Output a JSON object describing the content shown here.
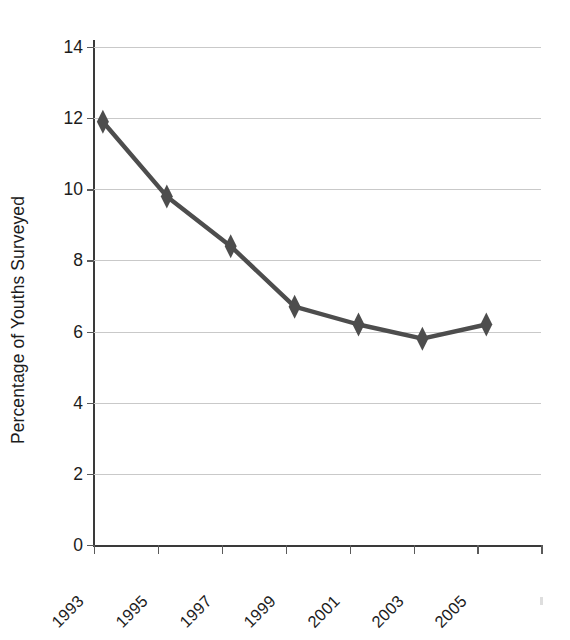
{
  "chart_data": {
    "type": "line",
    "title": "",
    "xlabel": "",
    "ylabel": "Percentage of Youths Surveyed",
    "x": [
      1993,
      1994,
      1995,
      1996,
      1997,
      1998,
      1999,
      2000,
      2001,
      2002,
      2003,
      2004,
      2005,
      2006
    ],
    "categories": [
      "1993",
      "1995",
      "1997",
      "1999",
      "2001",
      "2003",
      "2005"
    ],
    "values": [
      11.9,
      9.8,
      8.4,
      6.7,
      6.2,
      5.8,
      6.2
    ],
    "points": [
      {
        "label": "1993",
        "value": 11.9
      },
      {
        "label": "1995",
        "value": 9.8
      },
      {
        "label": "1997",
        "value": 8.4
      },
      {
        "label": "1999",
        "value": 6.7
      },
      {
        "label": "2001",
        "value": 6.2
      },
      {
        "label": "2003",
        "value": 5.8
      },
      {
        "label": "2005",
        "value": 6.2
      }
    ],
    "ylim": [
      0,
      14
    ],
    "ytick_labels": [
      "0",
      "2",
      "4",
      "6",
      "8",
      "10",
      "12",
      "14"
    ],
    "ytick_values": [
      0,
      2,
      4,
      6,
      8,
      10,
      12,
      14
    ],
    "xtick_labels": [
      "1993",
      "1995",
      "1997",
      "1999",
      "2001",
      "2003",
      "2005"
    ],
    "xtick_count": 8,
    "grid": true,
    "grid_axis": "y",
    "legend": false,
    "legend_position": "none",
    "marker": "diamond",
    "series": [
      {
        "name": "Percentage of Youths Surveyed",
        "values": [
          11.9,
          9.8,
          8.4,
          6.7,
          6.2,
          5.8,
          6.2
        ]
      }
    ]
  },
  "style": {
    "line_color": "#4d4d4d",
    "marker_color": "#4d4d4d",
    "grid_color": "#c9c9c9",
    "axis_color": "#3a3a3a",
    "text_color": "#1c1c1c",
    "background": "#ffffff"
  }
}
